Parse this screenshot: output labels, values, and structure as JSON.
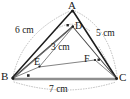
{
  "figure": {
    "type": "geometry-diagram",
    "shape": "triangle",
    "vertices": [
      {
        "id": "A",
        "label": "A",
        "x": 72,
        "y": 9
      },
      {
        "id": "B",
        "label": "B",
        "x": 11,
        "y": 78
      },
      {
        "id": "C",
        "label": "C",
        "x": 118,
        "y": 79
      }
    ],
    "interior_points": [
      {
        "id": "D",
        "label": "D",
        "x": 74,
        "y": 28
      },
      {
        "id": "E",
        "label": "E",
        "x": 41,
        "y": 64
      },
      {
        "id": "F",
        "label": "F",
        "x": 90,
        "y": 63
      }
    ],
    "measurements": [
      {
        "id": "AB",
        "label": "6 cm",
        "value": 6,
        "unit": "cm",
        "side": "AB"
      },
      {
        "id": "AC",
        "label": "5 cm",
        "value": 5,
        "unit": "cm",
        "side": "AC"
      },
      {
        "id": "DE",
        "label": "3 cm",
        "value": 3,
        "unit": "cm",
        "side": "interior"
      },
      {
        "id": "BC",
        "label": "7 cm",
        "value": 7,
        "unit": "cm",
        "side": "BC"
      }
    ],
    "colors": {
      "stroke": "#1d1d1d",
      "base": "#8f8f8f",
      "arc": "#b4b4b4",
      "thin": "#6d6d6d",
      "background": "#ffffff",
      "text": "#171717"
    }
  }
}
